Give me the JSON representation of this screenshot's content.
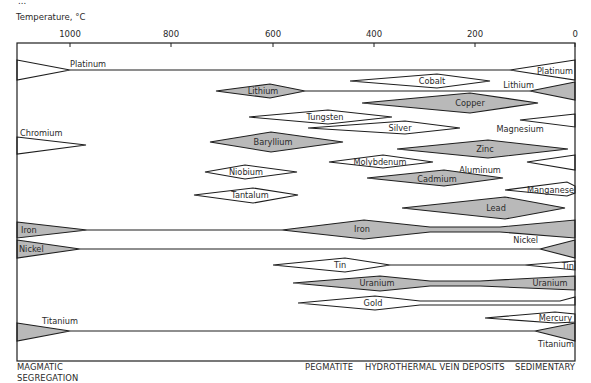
{
  "title_partial": "...",
  "axis": {
    "label": "Temperature, °C",
    "ticks": [
      {
        "value": 1000,
        "label": "1000",
        "x": 70
      },
      {
        "value": 800,
        "label": "800",
        "x": 171
      },
      {
        "value": 600,
        "label": "600",
        "x": 273
      },
      {
        "value": 400,
        "label": "400",
        "x": 374
      },
      {
        "value": 200,
        "label": "200",
        "x": 475
      },
      {
        "value": 0,
        "label": "0",
        "x": 575
      }
    ]
  },
  "frame": {
    "left": 17,
    "right": 575,
    "top": 43,
    "bottom": 361
  },
  "colors": {
    "fill_gray": "#b9b9b9",
    "fill_white": "#ffffff",
    "stroke": "#1e1e1e"
  },
  "footer": {
    "magmatic_line1": "MAGMATIC",
    "magmatic_line2": "SEGREGATION",
    "pegmatite": "PEGMATITE",
    "hydrothermal": "HYDROTHERMAL VEIN DEPOSITS",
    "sedimentary": "SEDIMENTARY"
  },
  "elements": [
    {
      "name": "Platinum",
      "fill": "white",
      "shapes": [
        {
          "type": "poly",
          "points": "17,60 70,70 17,80"
        },
        {
          "type": "line",
          "points": "70,70 510,70"
        },
        {
          "type": "poly",
          "points": "575,60 510,70 575,80"
        }
      ],
      "labels": [
        {
          "text": "Platinum",
          "x": 70,
          "y": 67,
          "anchor": "start"
        },
        {
          "text": "Platinum",
          "x": 573,
          "y": 74,
          "anchor": "end"
        }
      ]
    },
    {
      "name": "Cobalt",
      "fill": "white",
      "shapes": [
        {
          "type": "poly",
          "points": "350,81 437,74 490,81 437,88"
        }
      ],
      "labels": [
        {
          "text": "Cobalt",
          "x": 432,
          "y": 84,
          "anchor": "middle"
        }
      ]
    },
    {
      "name": "Lithium",
      "fill": "gray",
      "shapes": [
        {
          "type": "poly",
          "points": "216,91 270,84 305,91 270,98"
        },
        {
          "type": "line",
          "points": "305,91 530,91"
        },
        {
          "type": "poly",
          "points": "575,82 530,91 575,100"
        }
      ],
      "labels": [
        {
          "text": "Lithium",
          "x": 263,
          "y": 94,
          "anchor": "middle"
        },
        {
          "text": "Lithium",
          "x": 534,
          "y": 88,
          "anchor": "end"
        }
      ]
    },
    {
      "name": "Copper",
      "fill": "gray",
      "shapes": [
        {
          "type": "poly",
          "points": "362,103 470,93 538,103 470,113"
        }
      ],
      "labels": [
        {
          "text": "Copper",
          "x": 470,
          "y": 106,
          "anchor": "middle"
        }
      ]
    },
    {
      "name": "Tungsten",
      "fill": "white",
      "shapes": [
        {
          "type": "poly",
          "points": "249,117 328,110 392,117 328,124"
        }
      ],
      "labels": [
        {
          "text": "Tungsten",
          "x": 325,
          "y": 120,
          "anchor": "middle"
        }
      ]
    },
    {
      "name": "Magnesium",
      "fill": "white",
      "shapes": [
        {
          "type": "poly",
          "points": "575,114 520,120 575,127"
        }
      ],
      "labels": [
        {
          "text": "Magnesium",
          "x": 520,
          "y": 132,
          "anchor": "middle"
        }
      ]
    },
    {
      "name": "Silver",
      "fill": "white",
      "shapes": [
        {
          "type": "poly",
          "points": "308,128 405,121 460,128 405,134"
        }
      ],
      "labels": [
        {
          "text": "Silver",
          "x": 400,
          "y": 131,
          "anchor": "middle"
        }
      ]
    },
    {
      "name": "Chromium",
      "fill": "white",
      "shapes": [
        {
          "type": "poly",
          "points": "17,137 86,145 17,154"
        }
      ],
      "labels": [
        {
          "text": "Chromium",
          "x": 20,
          "y": 136,
          "anchor": "start"
        }
      ]
    },
    {
      "name": "Baryllium",
      "fill": "gray",
      "shapes": [
        {
          "type": "poly",
          "points": "210,142 271,132 343,142 271,152"
        }
      ],
      "labels": [
        {
          "text": "Baryllium",
          "x": 273,
          "y": 145,
          "anchor": "middle"
        }
      ]
    },
    {
      "name": "Zinc",
      "fill": "gray",
      "shapes": [
        {
          "type": "poly",
          "points": "397,149 488,140 568,149 488,158"
        }
      ],
      "labels": [
        {
          "text": "Zinc",
          "x": 485,
          "y": 152,
          "anchor": "middle"
        }
      ]
    },
    {
      "name": "Molybdenum",
      "fill": "white",
      "shapes": [
        {
          "type": "poly",
          "points": "329,162 383,155 433,162 383,168"
        }
      ],
      "labels": [
        {
          "text": "Molybdenum",
          "x": 380,
          "y": 165,
          "anchor": "middle"
        }
      ]
    },
    {
      "name": "Aluminum",
      "fill": "white",
      "shapes": [
        {
          "type": "poly",
          "points": "575,155 527,162 575,170"
        }
      ],
      "labels": [
        {
          "text": "Aluminum",
          "x": 480,
          "y": 173,
          "anchor": "middle"
        }
      ]
    },
    {
      "name": "Niobium",
      "fill": "white",
      "shapes": [
        {
          "type": "poly",
          "points": "205,172 245,165 297,172 245,179"
        }
      ],
      "labels": [
        {
          "text": "Niobium",
          "x": 246,
          "y": 175,
          "anchor": "middle"
        }
      ]
    },
    {
      "name": "Cadmium",
      "fill": "gray",
      "shapes": [
        {
          "type": "poly",
          "points": "367,178 444,170 503,178 444,186"
        }
      ],
      "labels": [
        {
          "text": "Cadmium",
          "x": 437,
          "y": 182,
          "anchor": "middle"
        }
      ]
    },
    {
      "name": "Manganese",
      "fill": "white",
      "shapes": [
        {
          "type": "poly",
          "points": "505,190 567,182 575,186 575,193 567,196"
        }
      ],
      "labels": [
        {
          "text": "Manganese",
          "x": 574,
          "y": 193,
          "anchor": "end"
        }
      ]
    },
    {
      "name": "Tantalum",
      "fill": "white",
      "shapes": [
        {
          "type": "poly",
          "points": "194,195 253,188 298,195 253,203"
        }
      ],
      "labels": [
        {
          "text": "Tantalum",
          "x": 250,
          "y": 198,
          "anchor": "middle"
        }
      ]
    },
    {
      "name": "Lead",
      "fill": "gray",
      "shapes": [
        {
          "type": "poly",
          "points": "402,208 505,197 565,208 505,219"
        }
      ],
      "labels": [
        {
          "text": "Lead",
          "x": 496,
          "y": 211,
          "anchor": "middle"
        }
      ]
    },
    {
      "name": "Iron",
      "fill": "gray",
      "shapes": [
        {
          "type": "poly",
          "points": "17,222 87,230 17,238"
        },
        {
          "type": "line",
          "points": "87,230 282,230"
        },
        {
          "type": "poly",
          "points": "282,230 364,220 430,227 500,227 575,220 575,238 500,232 430,232 364,239"
        }
      ],
      "labels": [
        {
          "text": "Iron",
          "x": 21,
          "y": 233,
          "anchor": "start"
        },
        {
          "text": "Iron",
          "x": 362,
          "y": 232,
          "anchor": "middle"
        }
      ]
    },
    {
      "name": "Nickel",
      "fill": "gray",
      "shapes": [
        {
          "type": "poly",
          "points": "17,240 80,249 17,258"
        },
        {
          "type": "line",
          "points": "80,249 540,249"
        },
        {
          "type": "poly",
          "points": "575,240 540,249 575,258"
        }
      ],
      "labels": [
        {
          "text": "Nickel",
          "x": 19,
          "y": 252,
          "anchor": "start"
        },
        {
          "text": "Nickel",
          "x": 538,
          "y": 243,
          "anchor": "end"
        }
      ]
    },
    {
      "name": "Tin",
      "fill": "white",
      "shapes": [
        {
          "type": "poly",
          "points": "273,265 345,258 390,265 345,272"
        },
        {
          "type": "line",
          "points": "390,265 525,265"
        },
        {
          "type": "poly",
          "points": "525,265 575,261 575,270"
        }
      ],
      "labels": [
        {
          "text": "Tin",
          "x": 340,
          "y": 268,
          "anchor": "middle"
        },
        {
          "text": "Tin",
          "x": 574,
          "y": 269,
          "anchor": "end"
        }
      ]
    },
    {
      "name": "Uranium",
      "fill": "gray",
      "shapes": [
        {
          "type": "poly",
          "points": "293,283 380,276 430,281 480,281 575,276 575,290 480,286 430,286 380,291"
        }
      ],
      "labels": [
        {
          "text": "Uranium",
          "x": 377,
          "y": 286,
          "anchor": "middle"
        },
        {
          "text": "Uranium",
          "x": 550,
          "y": 286,
          "anchor": "middle"
        }
      ]
    },
    {
      "name": "Gold",
      "fill": "white",
      "shapes": [
        {
          "type": "poly",
          "points": "298,303 375,296 420,301 560,301 575,297 575,305 560,305 420,305 375,310"
        }
      ],
      "labels": [
        {
          "text": "Gold",
          "x": 373,
          "y": 306,
          "anchor": "middle"
        }
      ]
    },
    {
      "name": "Mercury",
      "fill": "white",
      "shapes": [
        {
          "type": "poly",
          "points": "485,318 555,312 575,314 575,322 555,323"
        }
      ],
      "labels": [
        {
          "text": "Mercury",
          "x": 572,
          "y": 321,
          "anchor": "end"
        }
      ]
    },
    {
      "name": "Titanium",
      "fill": "gray",
      "shapes": [
        {
          "type": "poly",
          "points": "17,323 70,331 17,341"
        },
        {
          "type": "line",
          "points": "70,331 535,331"
        },
        {
          "type": "poly",
          "points": "575,323 535,331 575,341"
        }
      ],
      "labels": [
        {
          "text": "Titanium",
          "x": 42,
          "y": 324,
          "anchor": "start"
        },
        {
          "text": "Titanium",
          "x": 574,
          "y": 347,
          "anchor": "end"
        }
      ]
    }
  ]
}
